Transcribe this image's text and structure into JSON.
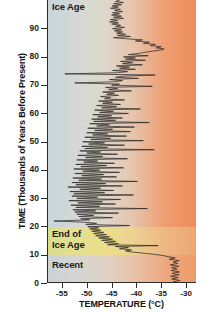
{
  "chart_data": {
    "type": "line",
    "title": "",
    "subtitle": "",
    "xlabel": "TEMPERATURE (°C)",
    "ylabel": "TIME (Thousands of Years Before Present)",
    "xlim": [
      -58,
      -28
    ],
    "ylim": [
      0,
      100
    ],
    "x_ticks": [
      -55,
      -50,
      -45,
      -40,
      -35,
      -30
    ],
    "x_tick_labels": [
      "-55",
      "-50",
      "-45",
      "-40",
      "-35",
      "-30"
    ],
    "y_ticks": [
      0,
      10,
      20,
      30,
      40,
      50,
      60,
      70,
      80,
      90
    ],
    "y_tick_labels": [
      "0",
      "10",
      "20",
      "30",
      "40",
      "50",
      "60",
      "70",
      "80",
      "90"
    ],
    "y_axis_inverted": true,
    "grid": false,
    "legend": null,
    "orientation": "vertical-time",
    "annotations": [
      {
        "text": "Ice Age",
        "y_range": [
          20,
          100
        ],
        "position": "top-left"
      },
      {
        "text": "End of\nIce Age",
        "y_range": [
          10,
          20
        ],
        "position": "mid-left"
      },
      {
        "text": "Recent",
        "y_range": [
          0,
          10
        ],
        "position": "bottom-left"
      }
    ],
    "bands": [
      {
        "name": "Ice Age",
        "y_from": 20,
        "y_to": 100,
        "color_left": "#c8d4dd",
        "color_right": "#ee8d5b"
      },
      {
        "name": "End of Ice Age",
        "y_from": 10,
        "y_to": 20,
        "color_left": "#d8de8f",
        "color_right": "#eda672"
      },
      {
        "name": "Recent",
        "y_from": 0,
        "y_to": 10,
        "color_left": "#c9d2d7",
        "color_right": "#ee9b68"
      }
    ],
    "series": [
      {
        "name": "Ice core temperature",
        "color": "#2e2a26",
        "units_x": "°C",
        "units_y": "thousands of years before present",
        "points": [
          [
            -31.5,
            0.0
          ],
          [
            -32.6,
            0.4
          ],
          [
            -31.2,
            0.9
          ],
          [
            -32.9,
            1.4
          ],
          [
            -31.6,
            1.9
          ],
          [
            -33.1,
            2.4
          ],
          [
            -31.4,
            2.9
          ],
          [
            -32.8,
            3.4
          ],
          [
            -31.3,
            3.9
          ],
          [
            -33.0,
            4.4
          ],
          [
            -31.8,
            4.9
          ],
          [
            -32.9,
            5.4
          ],
          [
            -31.5,
            5.9
          ],
          [
            -33.2,
            6.4
          ],
          [
            -31.7,
            6.9
          ],
          [
            -32.6,
            7.4
          ],
          [
            -31.4,
            7.9
          ],
          [
            -33.4,
            8.4
          ],
          [
            -32.2,
            8.9
          ],
          [
            -33.6,
            9.3
          ],
          [
            -34.6,
            9.7
          ],
          [
            -36.2,
            10.1
          ],
          [
            -38.4,
            10.5
          ],
          [
            -40.6,
            10.9
          ],
          [
            -42.2,
            11.3
          ],
          [
            -41.0,
            11.7
          ],
          [
            -43.4,
            12.1
          ],
          [
            -41.6,
            12.5
          ],
          [
            -44.2,
            12.9
          ],
          [
            -35.6,
            13.2
          ],
          [
            -45.8,
            13.5
          ],
          [
            -43.6,
            13.9
          ],
          [
            -46.4,
            14.3
          ],
          [
            -44.2,
            14.7
          ],
          [
            -47.0,
            15.1
          ],
          [
            -44.8,
            15.5
          ],
          [
            -47.6,
            15.9
          ],
          [
            -45.4,
            16.3
          ],
          [
            -48.2,
            16.7
          ],
          [
            -46.0,
            17.1
          ],
          [
            -48.6,
            17.5
          ],
          [
            -46.6,
            17.9
          ],
          [
            -49.0,
            18.3
          ],
          [
            -47.2,
            18.7
          ],
          [
            -49.4,
            19.1
          ],
          [
            -47.6,
            19.5
          ],
          [
            -49.8,
            19.9
          ],
          [
            -41.4,
            20.3
          ],
          [
            -50.2,
            20.7
          ],
          [
            -48.0,
            21.1
          ],
          [
            -50.6,
            21.5
          ],
          [
            -56.6,
            21.9
          ],
          [
            -49.4,
            22.3
          ],
          [
            -51.2,
            22.7
          ],
          [
            -44.8,
            23.1
          ],
          [
            -51.6,
            23.5
          ],
          [
            -48.6,
            23.9
          ],
          [
            -52.0,
            24.3
          ],
          [
            -43.6,
            24.7
          ],
          [
            -52.4,
            25.1
          ],
          [
            -48.2,
            25.5
          ],
          [
            -52.8,
            25.9
          ],
          [
            -37.8,
            26.3
          ],
          [
            -52.2,
            26.7
          ],
          [
            -47.4,
            27.1
          ],
          [
            -53.2,
            27.5
          ],
          [
            -44.2,
            27.9
          ],
          [
            -51.8,
            28.3
          ],
          [
            -46.8,
            28.7
          ],
          [
            -53.6,
            29.1
          ],
          [
            -43.2,
            29.5
          ],
          [
            -52.0,
            29.9
          ],
          [
            -47.8,
            30.3
          ],
          [
            -53.0,
            30.7
          ],
          [
            -40.6,
            31.1
          ],
          [
            -52.6,
            31.5
          ],
          [
            -46.4,
            31.9
          ],
          [
            -53.4,
            32.3
          ],
          [
            -44.6,
            32.7
          ],
          [
            -51.4,
            33.1
          ],
          [
            -47.2,
            33.5
          ],
          [
            -53.8,
            33.9
          ],
          [
            -42.8,
            34.3
          ],
          [
            -52.2,
            34.7
          ],
          [
            -46.2,
            35.1
          ],
          [
            -53.0,
            35.5
          ],
          [
            -39.8,
            35.9
          ],
          [
            -51.6,
            36.3
          ],
          [
            -47.0,
            36.7
          ],
          [
            -52.8,
            37.1
          ],
          [
            -44.0,
            37.5
          ],
          [
            -51.0,
            37.9
          ],
          [
            -46.6,
            38.3
          ],
          [
            -52.4,
            38.7
          ],
          [
            -43.4,
            39.1
          ],
          [
            -50.8,
            39.5
          ],
          [
            -47.4,
            39.9
          ],
          [
            -52.6,
            40.3
          ],
          [
            -42.6,
            40.7
          ],
          [
            -51.2,
            41.1
          ],
          [
            -46.0,
            41.5
          ],
          [
            -52.2,
            41.9
          ],
          [
            -44.4,
            42.3
          ],
          [
            -50.6,
            42.7
          ],
          [
            -47.8,
            43.1
          ],
          [
            -52.0,
            43.5
          ],
          [
            -41.8,
            43.9
          ],
          [
            -50.2,
            44.3
          ],
          [
            -46.8,
            44.7
          ],
          [
            -51.8,
            45.1
          ],
          [
            -43.8,
            45.5
          ],
          [
            -50.0,
            45.9
          ],
          [
            -47.2,
            46.3
          ],
          [
            -51.4,
            46.7
          ],
          [
            -36.4,
            47.1
          ],
          [
            -50.4,
            47.5
          ],
          [
            -45.8,
            47.9
          ],
          [
            -51.0,
            48.3
          ],
          [
            -42.4,
            48.7
          ],
          [
            -49.6,
            49.1
          ],
          [
            -46.4,
            49.5
          ],
          [
            -50.8,
            49.9
          ],
          [
            -38.6,
            50.3
          ],
          [
            -49.2,
            50.7
          ],
          [
            -45.2,
            51.1
          ],
          [
            -50.4,
            51.5
          ],
          [
            -42.0,
            51.9
          ],
          [
            -48.8,
            52.3
          ],
          [
            -45.8,
            52.7
          ],
          [
            -50.0,
            53.1
          ],
          [
            -41.2,
            53.5
          ],
          [
            -48.4,
            53.9
          ],
          [
            -44.8,
            54.3
          ],
          [
            -49.8,
            54.7
          ],
          [
            -40.4,
            55.1
          ],
          [
            -48.0,
            55.5
          ],
          [
            -45.4,
            55.9
          ],
          [
            -49.4,
            56.3
          ],
          [
            -37.4,
            56.7
          ],
          [
            -48.6,
            57.1
          ],
          [
            -44.2,
            57.5
          ],
          [
            -49.0,
            57.9
          ],
          [
            -42.8,
            58.3
          ],
          [
            -47.8,
            58.7
          ],
          [
            -45.0,
            59.1
          ],
          [
            -48.8,
            59.5
          ],
          [
            -41.6,
            59.9
          ],
          [
            -47.4,
            60.3
          ],
          [
            -44.6,
            60.7
          ],
          [
            -48.4,
            61.1
          ],
          [
            -39.2,
            61.5
          ],
          [
            -47.0,
            61.9
          ],
          [
            -44.0,
            62.3
          ],
          [
            -48.0,
            62.7
          ],
          [
            -43.2,
            63.1
          ],
          [
            -46.8,
            63.5
          ],
          [
            -44.8,
            63.9
          ],
          [
            -47.6,
            64.3
          ],
          [
            -42.4,
            64.7
          ],
          [
            -46.4,
            65.1
          ],
          [
            -45.2,
            65.5
          ],
          [
            -47.2,
            65.9
          ],
          [
            -43.6,
            66.3
          ],
          [
            -46.0,
            66.7
          ],
          [
            -44.4,
            67.1
          ],
          [
            -46.8,
            67.5
          ],
          [
            -41.0,
            67.9
          ],
          [
            -45.6,
            68.3
          ],
          [
            -43.8,
            68.7
          ],
          [
            -46.2,
            69.1
          ],
          [
            -36.8,
            69.5
          ],
          [
            -45.0,
            69.9
          ],
          [
            -43.4,
            70.3
          ],
          [
            -52.4,
            70.7
          ],
          [
            -44.6,
            71.1
          ],
          [
            -42.8,
            71.5
          ],
          [
            -45.4,
            71.9
          ],
          [
            -39.6,
            72.3
          ],
          [
            -44.2,
            72.7
          ],
          [
            -42.6,
            73.1
          ],
          [
            -36.2,
            73.5
          ],
          [
            -54.4,
            73.9
          ],
          [
            -43.8,
            74.3
          ],
          [
            -41.8,
            74.7
          ],
          [
            -44.8,
            75.1
          ],
          [
            -40.2,
            75.5
          ],
          [
            -43.4,
            75.9
          ],
          [
            -41.4,
            76.3
          ],
          [
            -44.0,
            76.7
          ],
          [
            -38.8,
            77.1
          ],
          [
            -42.8,
            77.5
          ],
          [
            -40.8,
            77.9
          ],
          [
            -43.2,
            78.3
          ],
          [
            -38.2,
            78.7
          ],
          [
            -42.2,
            79.1
          ],
          [
            -40.2,
            79.5
          ],
          [
            -42.6,
            79.9
          ],
          [
            -37.6,
            80.3
          ],
          [
            -41.6,
            80.7
          ],
          [
            -39.6,
            81.1
          ],
          [
            -38.4,
            81.5
          ],
          [
            -36.8,
            81.9
          ],
          [
            -35.2,
            82.3
          ],
          [
            -34.4,
            82.7
          ],
          [
            -36.0,
            83.1
          ],
          [
            -35.0,
            83.5
          ],
          [
            -37.2,
            83.9
          ],
          [
            -36.2,
            84.3
          ],
          [
            -38.6,
            84.7
          ],
          [
            -37.4,
            85.1
          ],
          [
            -40.2,
            85.5
          ],
          [
            -38.8,
            85.9
          ],
          [
            -42.0,
            86.3
          ],
          [
            -44.6,
            86.7
          ],
          [
            -41.2,
            87.1
          ],
          [
            -43.8,
            87.5
          ],
          [
            -42.2,
            87.9
          ],
          [
            -44.0,
            88.3
          ],
          [
            -42.8,
            88.7
          ],
          [
            -44.4,
            89.1
          ],
          [
            -43.0,
            89.5
          ],
          [
            -44.8,
            89.9
          ],
          [
            -42.4,
            90.3
          ],
          [
            -44.2,
            90.7
          ],
          [
            -43.2,
            91.1
          ],
          [
            -45.0,
            91.5
          ],
          [
            -43.6,
            91.9
          ],
          [
            -45.4,
            92.3
          ],
          [
            -43.8,
            92.7
          ],
          [
            -45.2,
            93.1
          ],
          [
            -42.6,
            93.5
          ],
          [
            -44.6,
            93.9
          ],
          [
            -43.0,
            94.3
          ],
          [
            -45.0,
            94.7
          ],
          [
            -43.4,
            95.1
          ],
          [
            -44.8,
            95.5
          ],
          [
            -42.8,
            95.9
          ],
          [
            -44.4,
            96.3
          ],
          [
            -43.2,
            96.7
          ],
          [
            -45.2,
            97.1
          ],
          [
            -43.6,
            97.5
          ],
          [
            -44.9,
            97.9
          ],
          [
            -43.0,
            98.3
          ],
          [
            -44.6,
            98.7
          ],
          [
            -42.6,
            99.1
          ],
          [
            -44.2,
            99.5
          ],
          [
            -43.4,
            100.0
          ]
        ]
      }
    ]
  },
  "axes": {
    "x_title": "TEMPERATURE (°C)",
    "y_title": "TIME (Thousands of Years Before Present)",
    "x_tick_labels": [
      "-55",
      "-50",
      "-45",
      "-40",
      "-35",
      "-30"
    ],
    "y_tick_labels": [
      "90",
      "80",
      "70",
      "60",
      "50",
      "40",
      "30",
      "20",
      "10",
      "0"
    ]
  },
  "annotations": {
    "ice_age": "Ice Age",
    "end_of_ice_age_line1": "End of",
    "end_of_ice_age_line2": "Ice Age",
    "recent": "Recent"
  },
  "colors": {
    "curve": "#2e2a26",
    "axis": "#2b2b2b",
    "text": "#111111",
    "band_ice_age_left": "#c8d4dd",
    "band_ice_age_right": "#ee8d5b",
    "band_end_ice_age_left": "#d8de8f",
    "band_end_ice_age_right": "#eda672",
    "band_recent_left": "#c9d2d7",
    "band_recent_right": "#ee9b68"
  }
}
